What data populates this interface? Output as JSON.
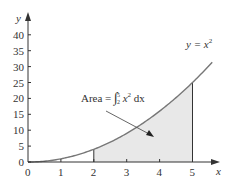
{
  "chart_data": {
    "type": "area",
    "title": "",
    "xlabel": "x",
    "ylabel": "y",
    "xlim": [
      0,
      5.7
    ],
    "ylim": [
      0,
      44
    ],
    "x_ticks": [
      "0",
      "1",
      "2",
      "3",
      "4",
      "5"
    ],
    "y_ticks": [
      "0",
      "5",
      "10",
      "15",
      "20",
      "25",
      "30",
      "35",
      "40"
    ],
    "curve": {
      "label": "y = x²",
      "function": "x^2",
      "x_range": [
        0,
        5.6
      ]
    },
    "shaded_region": {
      "from": 2,
      "to": 5,
      "label": "Area = ∫₂⁵ x² dx"
    },
    "series": [
      {
        "name": "y = x^2",
        "x": [
          0,
          1,
          2,
          3,
          4,
          5
        ],
        "y": [
          0,
          1,
          4,
          9,
          16,
          25
        ]
      }
    ]
  },
  "labels": {
    "y_axis": "y",
    "x_axis": "x",
    "curve_label": "y = x",
    "curve_exp": "2",
    "area_prefix": "Area =",
    "area_upper": "5",
    "area_lower": "2",
    "area_var": "x",
    "area_exp": "2",
    "area_dx": "dx"
  },
  "colors": {
    "curve": "#777777",
    "fill": "#e8e8e8",
    "axis": "#333333"
  }
}
